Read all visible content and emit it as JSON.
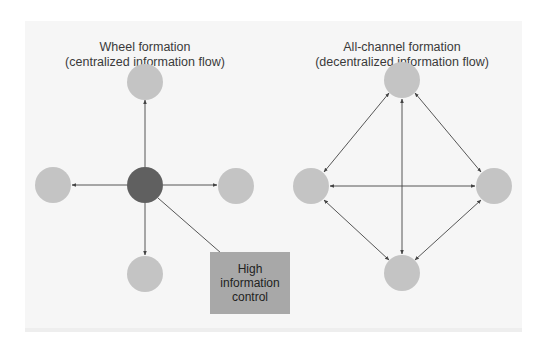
{
  "wheel": {
    "title": "Wheel formation",
    "subtitle": "(centralized information flow)",
    "callout": {
      "line1": "High",
      "line2": "information",
      "line3": "control"
    },
    "nodes": [
      {
        "id": "center",
        "role": "hub",
        "color": "#606060"
      },
      {
        "id": "top",
        "role": "member",
        "color": "#c4c4c4"
      },
      {
        "id": "left",
        "role": "member",
        "color": "#c4c4c4"
      },
      {
        "id": "right",
        "role": "member",
        "color": "#c4c4c4"
      },
      {
        "id": "bottom",
        "role": "member",
        "color": "#c4c4c4"
      }
    ],
    "edges": [
      {
        "from": "center",
        "to": "top",
        "direction": "one-way"
      },
      {
        "from": "center",
        "to": "left",
        "direction": "one-way"
      },
      {
        "from": "center",
        "to": "right",
        "direction": "one-way"
      },
      {
        "from": "center",
        "to": "bottom",
        "direction": "one-way"
      }
    ]
  },
  "all_channel": {
    "title": "All-channel formation",
    "subtitle": "(decentralized information flow)",
    "nodes": [
      {
        "id": "top",
        "color": "#c4c4c4"
      },
      {
        "id": "left",
        "color": "#c4c4c4"
      },
      {
        "id": "right",
        "color": "#c4c4c4"
      },
      {
        "id": "bottom",
        "color": "#c4c4c4"
      }
    ],
    "edges": [
      {
        "from": "top",
        "to": "left",
        "direction": "two-way"
      },
      {
        "from": "top",
        "to": "right",
        "direction": "two-way"
      },
      {
        "from": "left",
        "to": "bottom",
        "direction": "two-way"
      },
      {
        "from": "right",
        "to": "bottom",
        "direction": "two-way"
      },
      {
        "from": "left",
        "to": "right",
        "direction": "two-way"
      },
      {
        "from": "top",
        "to": "bottom",
        "direction": "two-way"
      }
    ]
  },
  "colors": {
    "panel": "#f6f6f6",
    "node_light": "#c4c4c4",
    "node_dark": "#606060",
    "callout": "#a8a8a8",
    "line": "#444444"
  }
}
